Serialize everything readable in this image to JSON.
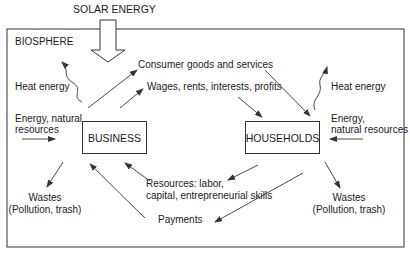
{
  "diagram": {
    "title": "SOLAR ENERGY",
    "container_label": "BIOSPHERE",
    "nodes": {
      "business": "BUSINESS",
      "households": "HOUSEHOLDS"
    },
    "flows": {
      "consumer_goods": "Consumer goods and services",
      "wages": "Wages, rents, interests, profits",
      "resources_line1": "Resources: labor,",
      "resources_line2": "capital, entrepreneurial skills",
      "payments": "Payments"
    },
    "left": {
      "heat": "Heat energy",
      "energy_line1": "Energy, natural",
      "energy_line2": "resources",
      "wastes_line1": "Wastes",
      "wastes_line2": "(Pollution, trash)"
    },
    "right": {
      "heat": "Heat energy",
      "energy_line1": "Energy,",
      "energy_line2": "natural resources",
      "wastes_line1": "Wastes",
      "wastes_line2": "(Pollution, trash)"
    },
    "colors": {
      "line": "#333333",
      "text": "#1a1a1a",
      "background": "#ffffff"
    }
  }
}
